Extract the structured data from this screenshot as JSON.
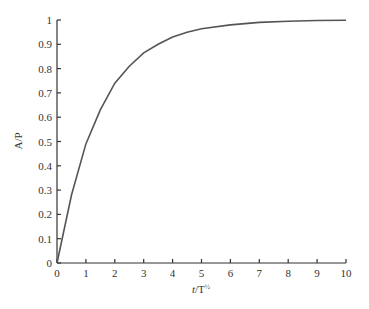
{
  "chart_data": {
    "type": "line",
    "title": "",
    "xlabel": "t/T½",
    "ylabel": "A/P",
    "xlim": [
      0,
      10
    ],
    "ylim": [
      0,
      1
    ],
    "grid": false,
    "legend": null,
    "x_ticks": [
      "0",
      "1",
      "2",
      "3",
      "4",
      "5",
      "6",
      "7",
      "8",
      "9",
      "10"
    ],
    "y_ticks": [
      "0",
      "0.1",
      "0.2",
      "0.3",
      "0.4",
      "0.5",
      "0.6",
      "0.7",
      "0.8",
      "0.9",
      "1"
    ],
    "series": [
      {
        "name": "A/P",
        "color": "#555555",
        "x": [
          0,
          0.5,
          1,
          1.5,
          2,
          2.5,
          3,
          3.5,
          4,
          4.5,
          5,
          6,
          7,
          8,
          9,
          10
        ],
        "y": [
          0,
          0.28,
          0.49,
          0.63,
          0.74,
          0.81,
          0.865,
          0.9,
          0.93,
          0.95,
          0.964,
          0.98,
          0.99,
          0.995,
          0.998,
          0.999
        ]
      }
    ]
  }
}
